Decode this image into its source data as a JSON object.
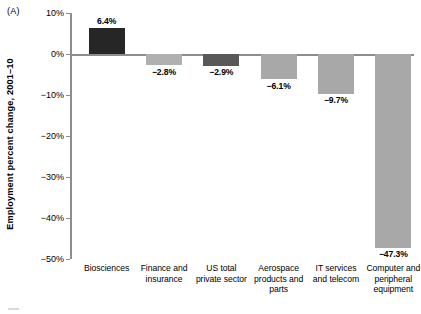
{
  "figure": {
    "panel_letter": "(A)",
    "y_axis_title": "Employment percent change, 2001–10"
  },
  "chart_data": {
    "type": "bar",
    "title": "",
    "subtitle": "",
    "xlabel": "",
    "ylabel": "Employment percent change, 2001–10",
    "ylim": [
      -50,
      10
    ],
    "yticks": [
      10,
      0,
      -10,
      -20,
      -30,
      -40,
      -50
    ],
    "ytick_labels": [
      "10%",
      "0%",
      "−10%",
      "−20%",
      "−30%",
      "−40%",
      "−50%"
    ],
    "grid": false,
    "legend": null,
    "orientation": "vertical",
    "baseline": 0,
    "categories": [
      "Biosciences",
      "Finance and insurance",
      "US total private sector",
      "Aerospace products and parts",
      "IT services and telecom",
      "Computer and peripheral equipment"
    ],
    "category_lines": [
      [
        "Biosciences"
      ],
      [
        "Finance and",
        "insurance"
      ],
      [
        "US total",
        "private sector"
      ],
      [
        "Aerospace",
        "products and",
        "parts"
      ],
      [
        "IT services",
        "and telecom"
      ],
      [
        "Computer and",
        "peripheral",
        "equipment"
      ]
    ],
    "values": [
      6.4,
      -2.8,
      -2.9,
      -6.1,
      -9.7,
      -47.3
    ],
    "value_labels": [
      "6.4%",
      "−2.8%",
      "−2.9%",
      "−6.1%",
      "−9.7%",
      "−47.3%"
    ],
    "bar_colors": [
      "#262626",
      "#b0b0b0",
      "#585858",
      "#a8a8a8",
      "#a8a8a8",
      "#a8a8a8"
    ],
    "axis_color": "#8d8d8d"
  }
}
